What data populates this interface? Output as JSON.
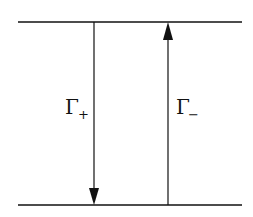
{
  "diagram": {
    "type": "two-level transition diagram",
    "levels": [
      {
        "id": "upper",
        "name": "upper-level"
      },
      {
        "id": "lower",
        "name": "lower-level"
      }
    ],
    "transitions": [
      {
        "id": "gamma-plus",
        "from": "upper",
        "to": "lower",
        "direction": "down",
        "symbol": "Γ",
        "subscript": "+"
      },
      {
        "id": "gamma-minus",
        "from": "lower",
        "to": "upper",
        "direction": "up",
        "symbol": "Γ",
        "subscript": "−"
      }
    ],
    "colors": {
      "line": "#111111",
      "background": "#ffffff"
    }
  }
}
